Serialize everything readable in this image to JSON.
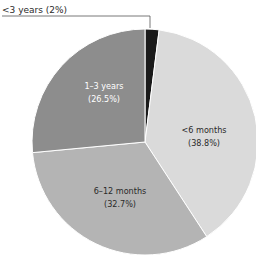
{
  "chart_data": {
    "type": "pie",
    "title": "",
    "start_angle_deg": -90,
    "direction": "clockwise",
    "slices": [
      {
        "label": "<3 years",
        "value": 2.0,
        "display": "(2%)",
        "color": "#1a1a1a",
        "callout": true
      },
      {
        "label": "<6 months",
        "value": 38.8,
        "display": "(38.8%)",
        "color": "#dadada"
      },
      {
        "label": "6–12 months",
        "value": 32.7,
        "display": "(32.7%)",
        "color": "#b4b4b4"
      },
      {
        "label": "1–3 years",
        "value": 26.5,
        "display": "(26.5%)",
        "color": "#8d8d8d",
        "light_text": true
      }
    ],
    "center": [
      145,
      142
    ],
    "radius": 113
  },
  "labels": {
    "callout": "<3 years (2%)",
    "lt6": {
      "name": "<6 months",
      "pct": "(38.8%)"
    },
    "m612": {
      "name": "6–12 months",
      "pct": "(32.7%)"
    },
    "y13": {
      "name": "1–3 years",
      "pct": "(26.5%)"
    }
  }
}
